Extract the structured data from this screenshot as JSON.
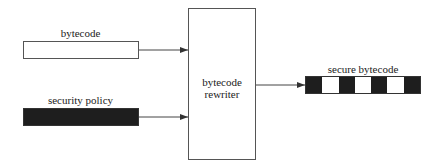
{
  "diagram": {
    "inputs": [
      {
        "label": "bytecode",
        "fill": "white"
      },
      {
        "label": "security policy",
        "fill": "black"
      }
    ],
    "processor": {
      "line1": "bytecode",
      "line2": "rewriter"
    },
    "output": {
      "label": "secure bytecode",
      "segments": [
        "black",
        "white",
        "black",
        "white",
        "black",
        "white",
        "black"
      ]
    },
    "colors": {
      "dark": "#1e1e1e",
      "light": "#ffffff",
      "stroke": "#555555"
    }
  }
}
